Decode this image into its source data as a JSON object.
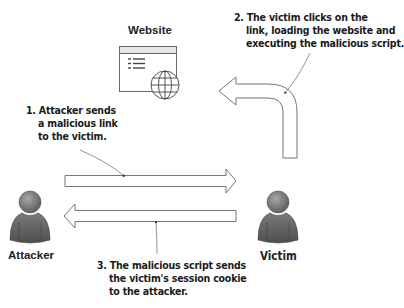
{
  "diagram": {
    "nodes": {
      "website": {
        "label": "Website",
        "icon": "browser-window-globe-icon"
      },
      "attacker": {
        "label": "Attacker",
        "icon": "user-avatar-icon"
      },
      "victim": {
        "label": "Victim",
        "icon": "user-avatar-icon"
      }
    },
    "steps": [
      {
        "number": "1.",
        "lines": [
          "1. Attacker sends",
          "a malicious link",
          "to the victim."
        ],
        "from": "attacker",
        "to": "victim"
      },
      {
        "number": "2.",
        "lines": [
          "2. The victim clicks on the",
          "link, loading the website and",
          "executing the malicious script."
        ],
        "from": "victim",
        "to": "website"
      },
      {
        "number": "3.",
        "lines": [
          "3. The malicious script sends",
          "the victim's session cookie",
          "to the attacker."
        ],
        "from": "victim",
        "to": "attacker"
      }
    ],
    "colors": {
      "arrow_stroke": "#777777",
      "arrow_fill": "#ffffff",
      "avatar_fill": "#6e6e6e",
      "avatar_dark": "#4a4a4a",
      "text": "#1a1a1a",
      "leader_line": "#555555"
    }
  }
}
